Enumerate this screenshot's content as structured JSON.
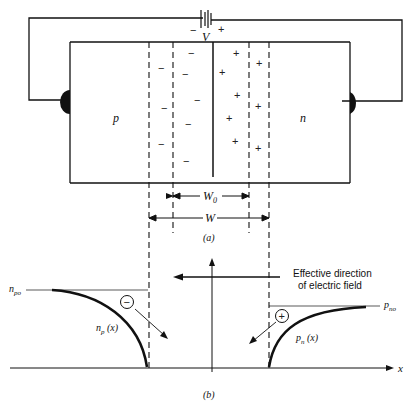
{
  "figure_a": {
    "caption": "(a)",
    "battery": {
      "label": "V",
      "neg": "−",
      "pos": "+"
    },
    "p_region_label": "p",
    "n_region_label": "n",
    "neg_charge_symbol": "−",
    "pos_charge_symbol": "+",
    "w0_label": "W",
    "w0_sub": "0",
    "w_label": "W"
  },
  "figure_b": {
    "caption": "(b)",
    "field_label_line1": "Effective direction",
    "field_label_line2": "of electric field",
    "npo_label": "n",
    "npo_sub": "po",
    "pno_label": "p",
    "pno_sub": "no",
    "np_curve_label": "n",
    "np_curve_sub": "p",
    "np_curve_arg": " (x)",
    "pn_curve_label": "p",
    "pn_curve_sub": "n",
    "pn_curve_arg": " (x)",
    "electron_symbol": "−",
    "hole_symbol": "+",
    "x_axis_label": "x"
  }
}
